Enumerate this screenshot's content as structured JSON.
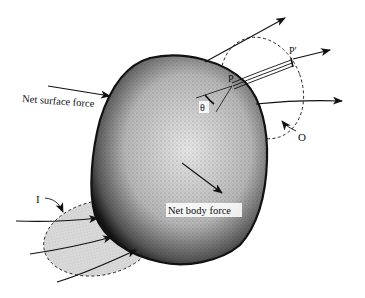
{
  "figure": {
    "labels": {
      "net_surface_force": "Net surface force",
      "net_body_force": "Net body force",
      "point_p": "P",
      "point_p_prime": "P′",
      "theta": "θ",
      "outflow_region": "O",
      "inflow_region": "I"
    },
    "colors": {
      "body_fill": "#8a8a8a",
      "body_edge": "#111111",
      "inflow_shade": "#d4d4d4",
      "line": "#111111"
    }
  }
}
